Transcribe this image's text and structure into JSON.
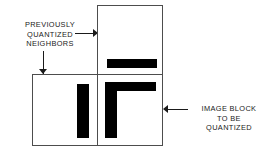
{
  "figure": {
    "width": 272,
    "height": 154,
    "background_color": "#ffffff",
    "line_color": "#4d4d4d",
    "feature_color": "#000000",
    "text_color": "#1a1a1a"
  },
  "annotations": {
    "neighbors": {
      "lines": [
        "PREVIOUSLY",
        "QUANTIZED",
        "NEIGHBORS"
      ],
      "arrow_right": "arrow-right",
      "arrow_down": "arrow-down"
    },
    "image_block": {
      "lines": [
        "IMAGE BLOCK",
        "TO BE",
        "QUANTIZED"
      ],
      "arrow_left": "arrow-left"
    }
  },
  "blocks": {
    "top": {
      "role": "previously-quantized-neighbor-above"
    },
    "left": {
      "role": "previously-quantized-neighbor-left"
    },
    "main": {
      "role": "image-block-to-be-quantized"
    }
  }
}
